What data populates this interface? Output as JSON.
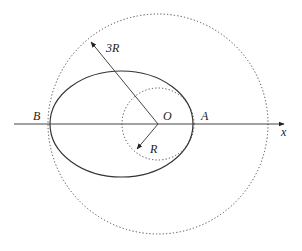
{
  "diagram": {
    "labels": {
      "three_r": "3R",
      "r": "R",
      "origin": "O",
      "point_a": "A",
      "point_b": "B",
      "x_axis": "x"
    },
    "shapes": {
      "large_circle": {
        "style": "dotted",
        "radius_label": "3R"
      },
      "small_circle": {
        "style": "dotted",
        "radius_label": "R"
      },
      "ellipse": {
        "style": "solid",
        "vertices": [
          "B",
          "A"
        ]
      },
      "x_axis": {
        "style": "solid",
        "direction": "right"
      }
    },
    "colors": {
      "stroke": "#333333",
      "background": "#ffffff"
    }
  }
}
